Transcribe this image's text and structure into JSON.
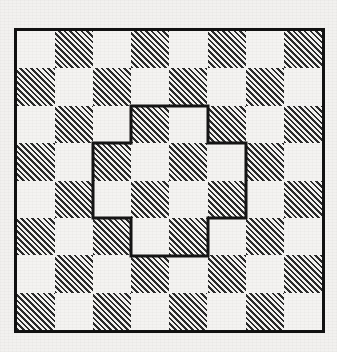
{
  "figure": {
    "kind": "checkerboard-with-outlined-region",
    "caption": "",
    "background_color": "#f2f1ef",
    "paper_color": "#f4f3f1",
    "ink_color": "#1a1a1a"
  },
  "board": {
    "columns": 8,
    "rows": 8,
    "origin_x": 17,
    "origin_y": 31,
    "cell_width": 38.1,
    "cell_height": 37.4,
    "border_color": "#111111",
    "border_width": 3,
    "light_color": "#f4f3f1",
    "dark_color": "#2b2b2b",
    "dark_fill_style": "diagonal-hatch-45",
    "top_left_cell_shade": "light",
    "shading_rule": "dark when (row + col) is odd",
    "cells": [
      [
        "light",
        "dark",
        "light",
        "dark",
        "light",
        "dark",
        "light",
        "dark"
      ],
      [
        "dark",
        "light",
        "dark",
        "light",
        "dark",
        "light",
        "dark",
        "light"
      ],
      [
        "light",
        "dark",
        "light",
        "dark",
        "light",
        "dark",
        "light",
        "dark"
      ],
      [
        "dark",
        "light",
        "dark",
        "light",
        "dark",
        "light",
        "dark",
        "light"
      ],
      [
        "light",
        "dark",
        "light",
        "dark",
        "light",
        "dark",
        "light",
        "dark"
      ],
      [
        "dark",
        "light",
        "dark",
        "light",
        "dark",
        "light",
        "dark",
        "light"
      ],
      [
        "light",
        "dark",
        "light",
        "dark",
        "light",
        "dark",
        "light",
        "dark"
      ],
      [
        "dark",
        "light",
        "dark",
        "light",
        "dark",
        "light",
        "dark",
        "light"
      ]
    ]
  },
  "region": {
    "label": "outlined-plus-region",
    "shape": "plus",
    "cell_count": 12,
    "stroke_color": "#151515",
    "stroke_width": 3,
    "fill": "none",
    "cells_by_row": [
      {
        "row": 2,
        "col_start": 3,
        "col_end": 4
      },
      {
        "row": 3,
        "col_start": 2,
        "col_end": 5
      },
      {
        "row": 4,
        "col_start": 2,
        "col_end": 5
      },
      {
        "row": 5,
        "col_start": 3,
        "col_end": 4
      }
    ],
    "outline_points_px": [
      [
        131,
        106
      ],
      [
        208,
        106
      ],
      [
        208,
        143
      ],
      [
        246,
        143
      ],
      [
        246,
        218
      ],
      [
        208,
        218
      ],
      [
        208,
        256
      ],
      [
        131,
        256
      ],
      [
        131,
        218
      ],
      [
        93,
        218
      ],
      [
        93,
        143
      ],
      [
        131,
        143
      ]
    ]
  }
}
